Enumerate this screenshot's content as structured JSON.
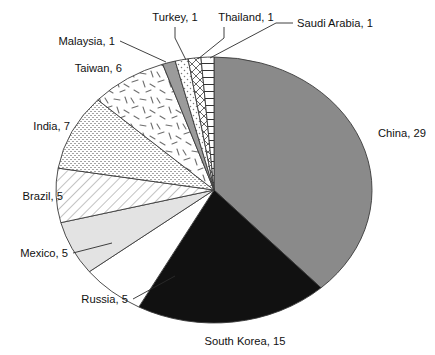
{
  "chart_data": {
    "type": "pie",
    "title": "",
    "subtitle": "",
    "xlabel": "",
    "ylabel": "",
    "legend_position": "none",
    "grid": false,
    "total": 76,
    "units": "count",
    "start_angle_deg": -90,
    "direction": "clockwise",
    "categories": [
      "China",
      "South Korea",
      "Russia",
      "Mexico",
      "Brazil",
      "India",
      "Taiwan",
      "Malaysia",
      "Turkey",
      "Thailand",
      "Saudi Arabia"
    ],
    "values": [
      29,
      15,
      5,
      5,
      5,
      7,
      6,
      1,
      1,
      1,
      1
    ],
    "slices": [
      {
        "label": "China, 29",
        "name": "China",
        "value": 29,
        "fill": "#8a8a8a",
        "pattern": "solid-gray",
        "label_x": 378,
        "label_y": 137,
        "anchor": "start",
        "leader": false
      },
      {
        "label": "South Korea, 15",
        "name": "South Korea",
        "value": 15,
        "fill": "#111111",
        "pattern": "solid-black",
        "label_x": 245,
        "label_y": 345,
        "anchor": "middle",
        "leader": false
      },
      {
        "label": "Russia, 5",
        "name": "Russia",
        "value": 5,
        "fill": "#ffffff",
        "pattern": "solid-white",
        "label_x": 128,
        "label_y": 303,
        "anchor": "end",
        "leader": true,
        "leader_points": "133,299 175,276"
      },
      {
        "label": "Mexico, 5",
        "name": "Mexico",
        "value": 5,
        "fill": "#e3e3e3",
        "pattern": "solid-light-gray",
        "label_x": 68,
        "label_y": 257,
        "anchor": "end",
        "leader": true,
        "leader_points": "73,253 112,243"
      },
      {
        "label": "Brazil, 5",
        "name": "Brazil",
        "value": 5,
        "fill": "#ffffff",
        "pattern": "diagonal-hatch",
        "label_x": 63,
        "label_y": 200,
        "anchor": "end",
        "leader": false
      },
      {
        "label": "India, 7",
        "name": "India",
        "value": 7,
        "fill": "#ffffff",
        "pattern": "fine-dot-stipple",
        "label_x": 70,
        "label_y": 130,
        "anchor": "end",
        "leader": false
      },
      {
        "label": "Taiwan, 6",
        "name": "Taiwan",
        "value": 6,
        "fill": "#ffffff",
        "pattern": "random-dashes",
        "label_x": 122,
        "label_y": 72,
        "anchor": "end",
        "leader": false
      },
      {
        "label": "Malaysia, 1",
        "name": "Malaysia",
        "value": 1,
        "fill": "#9b9b9b",
        "pattern": "solid-mid-gray",
        "label_x": 115,
        "label_y": 45,
        "anchor": "end",
        "leader": true,
        "leader_points": "120,41 166,62"
      },
      {
        "label": "Turkey, 1",
        "name": "Turkey",
        "value": 1,
        "fill": "#ffffff",
        "pattern": "sparse-dots",
        "label_x": 175,
        "label_y": 21,
        "anchor": "middle",
        "leader": true,
        "leader_points": "175,27 175,38 186,60"
      },
      {
        "label": "Thailand, 1",
        "name": "Thailand",
        "value": 1,
        "fill": "#ffffff",
        "pattern": "cross-hatch",
        "label_x": 246,
        "label_y": 21,
        "anchor": "middle",
        "leader": true,
        "leader_points": "224,27 224,38 198,59"
      },
      {
        "label": "Saudi Arabia, 1",
        "name": "Saudi Arabia",
        "value": 1,
        "fill": "#ffffff",
        "pattern": "horizontal-lines",
        "label_x": 297,
        "label_y": 27,
        "anchor": "start",
        "leader": true,
        "leader_points": "293,23 276,23 210,58"
      }
    ],
    "geometry": {
      "center_x": 214,
      "center_y": 190,
      "radius_x": 158,
      "radius_y": 133
    }
  }
}
